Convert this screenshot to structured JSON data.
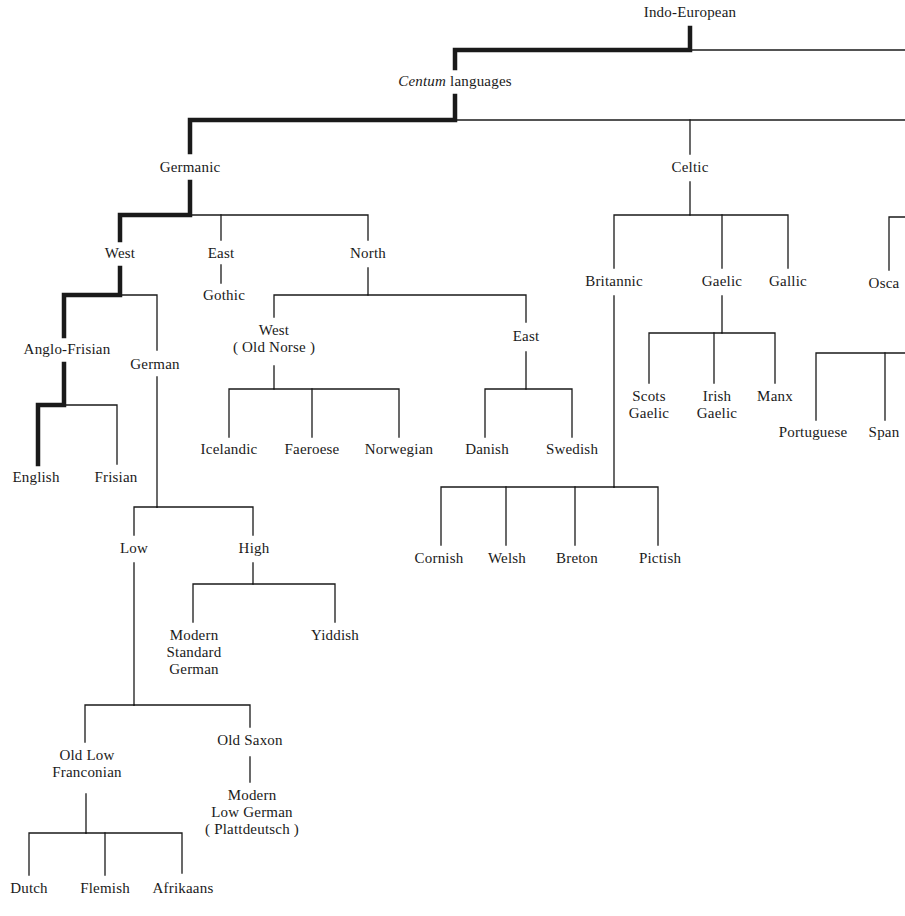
{
  "diagram": {
    "title": "Indo-European",
    "type": "tree",
    "highlighted_path": [
      "Indo-European",
      "Centum languages",
      "Germanic",
      "West",
      "Anglo-Frisian",
      "English"
    ],
    "colors": {
      "line": "#1a1a1a",
      "text": "#1a1a1a",
      "background": "#ffffff"
    }
  },
  "nodes": [
    {
      "id": "indo-european",
      "lines": [
        "Indo-European"
      ],
      "x": 690,
      "y": 4
    },
    {
      "id": "centum",
      "lines": [
        "Centum languages"
      ],
      "italic_prefix": "Centum",
      "rest": " languages",
      "x": 455,
      "y": 73
    },
    {
      "id": "germanic",
      "lines": [
        "Germanic"
      ],
      "x": 190,
      "y": 159
    },
    {
      "id": "celtic",
      "lines": [
        "Celtic"
      ],
      "x": 690,
      "y": 159
    },
    {
      "id": "west",
      "lines": [
        "West"
      ],
      "x": 120,
      "y": 245
    },
    {
      "id": "east",
      "lines": [
        "East"
      ],
      "x": 221,
      "y": 245
    },
    {
      "id": "north",
      "lines": [
        "North"
      ],
      "x": 368,
      "y": 245
    },
    {
      "id": "gothic",
      "lines": [
        "Gothic"
      ],
      "x": 224,
      "y": 287
    },
    {
      "id": "anglo-frisian",
      "lines": [
        "Anglo-Frisian"
      ],
      "x": 67,
      "y": 341
    },
    {
      "id": "german",
      "lines": [
        "German"
      ],
      "x": 155,
      "y": 356
    },
    {
      "id": "west-old-norse",
      "lines": [
        "West",
        "( Old Norse )"
      ],
      "x": 274,
      "y": 322
    },
    {
      "id": "east-norse",
      "lines": [
        "East"
      ],
      "x": 526,
      "y": 328
    },
    {
      "id": "britannic",
      "lines": [
        "Britannic"
      ],
      "x": 614,
      "y": 273
    },
    {
      "id": "gaelic",
      "lines": [
        "Gaelic"
      ],
      "x": 722,
      "y": 273
    },
    {
      "id": "gallic",
      "lines": [
        "Gallic"
      ],
      "x": 788,
      "y": 273
    },
    {
      "id": "oscan",
      "lines": [
        "Osca"
      ],
      "x": 884,
      "y": 275
    },
    {
      "id": "english",
      "lines": [
        "English"
      ],
      "x": 36,
      "y": 469
    },
    {
      "id": "frisian",
      "lines": [
        "Frisian"
      ],
      "x": 116,
      "y": 469
    },
    {
      "id": "icelandic",
      "lines": [
        "Icelandic"
      ],
      "x": 229,
      "y": 441
    },
    {
      "id": "faeroese",
      "lines": [
        "Faeroese"
      ],
      "x": 312,
      "y": 441
    },
    {
      "id": "norwegian",
      "lines": [
        "Norwegian"
      ],
      "x": 399,
      "y": 441
    },
    {
      "id": "danish",
      "lines": [
        "Danish"
      ],
      "x": 487,
      "y": 441
    },
    {
      "id": "swedish",
      "lines": [
        "Swedish"
      ],
      "x": 572,
      "y": 441
    },
    {
      "id": "scots-gaelic",
      "lines": [
        "Scots",
        "Gaelic"
      ],
      "x": 649,
      "y": 388
    },
    {
      "id": "irish-gaelic",
      "lines": [
        "Irish",
        "Gaelic"
      ],
      "x": 717,
      "y": 388
    },
    {
      "id": "manx",
      "lines": [
        "Manx"
      ],
      "x": 775,
      "y": 388
    },
    {
      "id": "portuguese",
      "lines": [
        "Portuguese"
      ],
      "x": 813,
      "y": 424
    },
    {
      "id": "spanish",
      "lines": [
        "Span"
      ],
      "x": 884,
      "y": 424
    },
    {
      "id": "low",
      "lines": [
        "Low"
      ],
      "x": 134,
      "y": 540
    },
    {
      "id": "high",
      "lines": [
        "High"
      ],
      "x": 254,
      "y": 540
    },
    {
      "id": "cornish",
      "lines": [
        "Cornish"
      ],
      "x": 439,
      "y": 550
    },
    {
      "id": "welsh",
      "lines": [
        "Welsh"
      ],
      "x": 507,
      "y": 550
    },
    {
      "id": "breton",
      "lines": [
        "Breton"
      ],
      "x": 577,
      "y": 550
    },
    {
      "id": "pictish",
      "lines": [
        "Pictish"
      ],
      "x": 660,
      "y": 550
    },
    {
      "id": "modern-standard-german",
      "lines": [
        "Modern",
        "Standard",
        "German"
      ],
      "x": 194,
      "y": 627
    },
    {
      "id": "yiddish",
      "lines": [
        "Yiddish"
      ],
      "x": 335,
      "y": 627
    },
    {
      "id": "old-low-franconian",
      "lines": [
        "Old Low",
        "Franconian"
      ],
      "x": 87,
      "y": 747
    },
    {
      "id": "old-saxon",
      "lines": [
        "Old Saxon"
      ],
      "x": 250,
      "y": 732
    },
    {
      "id": "modern-low-german",
      "lines": [
        "Modern",
        "Low German",
        "( Plattdeutsch )"
      ],
      "x": 252,
      "y": 787
    },
    {
      "id": "dutch",
      "lines": [
        "Dutch"
      ],
      "x": 29,
      "y": 880
    },
    {
      "id": "flemish",
      "lines": [
        "Flemish"
      ],
      "x": 105,
      "y": 880
    },
    {
      "id": "afrikaans",
      "lines": [
        "Afrikaans"
      ],
      "x": 183,
      "y": 880
    }
  ],
  "edges": {
    "thick": [
      "M690,28 L690,50 L455,50 L455,68",
      "M455,96 L455,120 L190,120 L190,152",
      "M190,182 L190,215 L120,215 L120,240",
      "M120,268 L120,295 L64,295 L64,336",
      "M64,364 L64,405 L38,405 L38,464"
    ],
    "thin": [
      "M690,50 L905,50",
      "M455,120 L905,120",
      "M690,120 L690,154",
      "M190,215 L368,215 L368,240",
      "M221,215 L221,240",
      "M221,265 L221,283",
      "M120,295 L157,295 L157,350",
      "M64,405 L117,405 L117,464",
      "M368,268 L368,295 L274,295 L274,317",
      "M368,295 L526,295 L526,322",
      "M274,366 L274,389 L229,389 L229,437",
      "M274,389 L399,389 L399,437",
      "M312,389 L312,437",
      "M526,352 L526,389 L485,389 L485,437",
      "M526,389 L572,389 L572,437",
      "M690,182 L690,215 L614,215 L614,268",
      "M690,215 L788,215 L788,268",
      "M722,215 L722,268",
      "M614,296 L614,487",
      "M722,296 L722,333 L649,333 L649,383",
      "M722,333 L775,333 L775,383",
      "M714,333 L714,383",
      "M614,487 L441,487 L441,545",
      "M614,487 L658,487 L658,545",
      "M506,487 L506,545",
      "M575,487 L575,545",
      "M905,217 L889,217 L889,270",
      "M905,353 L816,353 L816,420",
      "M885,353 L885,420",
      "M157,377 L157,507",
      "M157,507 L134,507 L134,535",
      "M157,507 L253,507 L253,535",
      "M134,563 L134,705",
      "M253,563 L253,584 L193,584 L193,622",
      "M253,584 L335,584 L335,622",
      "M134,705 L85,705 L85,742",
      "M134,705 L250,705 L250,727",
      "M250,757 L250,782",
      "M86,794 L86,833",
      "M86,833 L29,833 L29,875",
      "M86,833 L182,833 L182,873",
      "M105,833 L105,875"
    ]
  }
}
